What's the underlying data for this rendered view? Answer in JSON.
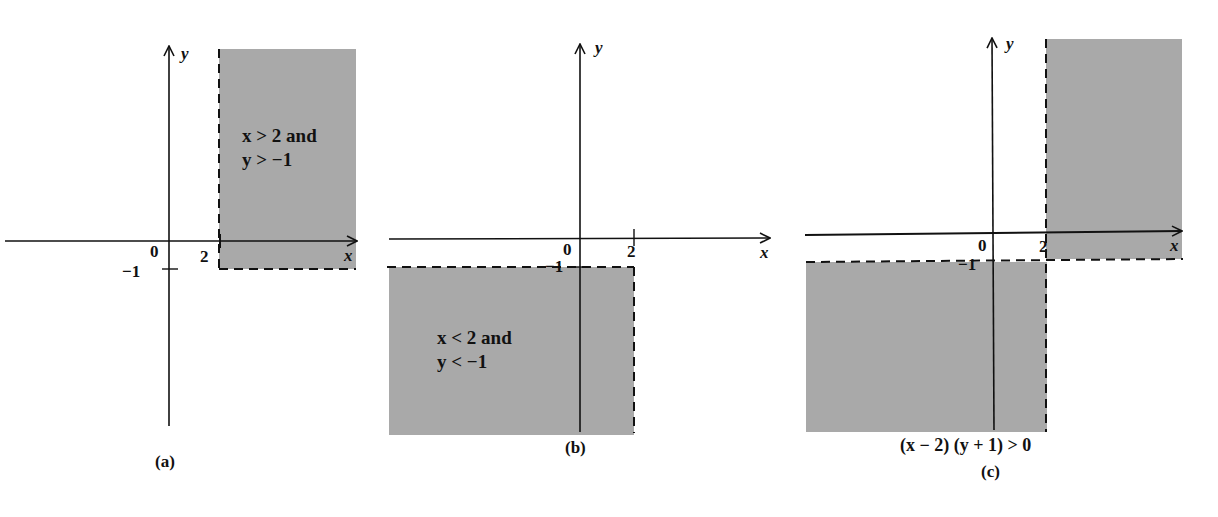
{
  "figure": {
    "panels": [
      {
        "id": "a",
        "caption": "(a)",
        "region_label_line1": "x > 2 and",
        "region_label_line2": "y > −1",
        "x_axis_label": "x",
        "y_axis_label": "y",
        "origin_label": "0",
        "x_tick_label": "2",
        "y_tick_label": "−1"
      },
      {
        "id": "b",
        "caption": "(b)",
        "region_label_line1": "x < 2 and",
        "region_label_line2": "y < −1",
        "x_axis_label": "x",
        "y_axis_label": "y",
        "origin_label": "0",
        "x_tick_label": "2",
        "y_tick_label": "−1"
      },
      {
        "id": "c",
        "caption": "(c)",
        "inequality": "(x − 2) (y + 1) > 0",
        "x_axis_label": "x",
        "y_axis_label": "y",
        "origin_label": "0",
        "x_tick_label": "2",
        "y_tick_label": "−1"
      }
    ],
    "colors": {
      "shade": "#a9a9a9",
      "axis": "#111111",
      "background": "#ffffff"
    }
  }
}
